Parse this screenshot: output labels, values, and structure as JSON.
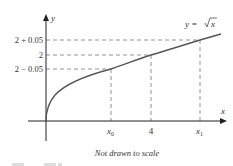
{
  "figure": {
    "function_label": "y = √x",
    "function_label_prefix": "y = ",
    "function_label_radicand": "x",
    "axes": {
      "x_label": "x",
      "y_label": "y"
    },
    "y_ticks": [
      {
        "label": "2 + 0.05",
        "value": 2.05
      },
      {
        "label": "2",
        "value": 2
      },
      {
        "label": "2 − 0.05",
        "value": 1.95
      }
    ],
    "x_ticks": [
      {
        "label": "x",
        "subscript": "0"
      },
      {
        "label": "4",
        "subscript": ""
      },
      {
        "label": "x",
        "subscript": "1"
      }
    ],
    "caption": "Not drawn to scale",
    "colors": {
      "curve": "#555555",
      "axis": "#222222",
      "guide": "#777777",
      "text": "#333333"
    }
  }
}
